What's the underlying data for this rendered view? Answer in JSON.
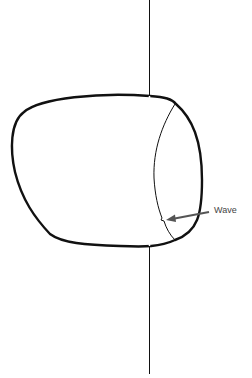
{
  "diagram": {
    "labels": {
      "wave": "Wave"
    },
    "colors": {
      "outline": "#111111",
      "arrow": "#555555",
      "axis": "#111111"
    }
  }
}
